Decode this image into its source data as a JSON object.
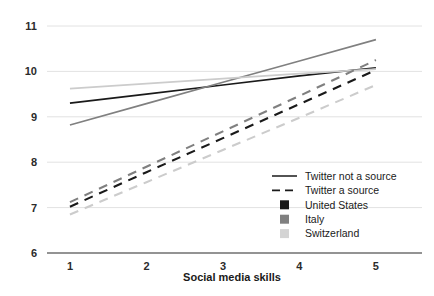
{
  "chart_data": {
    "type": "line",
    "title": "",
    "xlabel": "Social media skills",
    "ylabel": "",
    "x": [
      1,
      2,
      3,
      4,
      5
    ],
    "xlim": [
      0.7,
      5.55
    ],
    "ylim": [
      6,
      11
    ],
    "xticks": [
      "1",
      "2",
      "3",
      "4",
      "5"
    ],
    "yticks": [
      "6",
      "7",
      "8",
      "9",
      "10",
      "11"
    ],
    "grid": "horizontal",
    "legend_position": "bottom-right",
    "series": [
      {
        "name": "United States – Twitter not a source",
        "country": "United States",
        "condition": "Twitter not a source",
        "style": "solid",
        "color": "#1a1a1a",
        "values": [
          9.3,
          9.5,
          9.7,
          9.9,
          10.08
        ]
      },
      {
        "name": "Italy – Twitter not a source",
        "country": "Italy",
        "condition": "Twitter not a source",
        "style": "solid",
        "color": "#808080",
        "values": [
          8.82,
          9.29,
          9.76,
          10.23,
          10.7
        ]
      },
      {
        "name": "Switzerland – Twitter not a source",
        "country": "Switzerland",
        "condition": "Twitter not a source",
        "style": "solid",
        "color": "#cccccc",
        "values": [
          9.62,
          9.73,
          9.84,
          9.95,
          10.05
        ]
      },
      {
        "name": "United States – Twitter a source",
        "country": "United States",
        "condition": "Twitter a source",
        "style": "dashed",
        "color": "#1a1a1a",
        "values": [
          7.02,
          7.78,
          8.53,
          9.28,
          10.03
        ]
      },
      {
        "name": "Italy – Twitter a source",
        "country": "Italy",
        "condition": "Twitter a source",
        "style": "dashed",
        "color": "#808080",
        "values": [
          7.12,
          7.9,
          8.68,
          9.46,
          10.25
        ]
      },
      {
        "name": "Switzerland – Twitter a source",
        "country": "Switzerland",
        "condition": "Twitter a source",
        "style": "dashed",
        "color": "#cccccc",
        "values": [
          6.85,
          7.56,
          8.27,
          8.98,
          9.7
        ]
      }
    ],
    "legend": [
      {
        "label": "Twitter not a source",
        "marker": "solid-line",
        "color": "#1a1a1a"
      },
      {
        "label": "Twitter a source",
        "marker": "dashed-line",
        "color": "#1a1a1a"
      },
      {
        "label": "United States",
        "marker": "square",
        "color": "#1a1a1a"
      },
      {
        "label": "Italy",
        "marker": "square",
        "color": "#808080"
      },
      {
        "label": "Switzerland",
        "marker": "square",
        "color": "#d4d4d4"
      }
    ]
  },
  "axes": {
    "y_labels": [
      "11",
      "10",
      "9",
      "8",
      "7",
      "6"
    ],
    "x_labels": [
      "1",
      "2",
      "3",
      "4",
      "5"
    ],
    "x_title": "Social media skills"
  },
  "colors": {
    "united_states": "#1a1a1a",
    "italy": "#808080",
    "switzerland": "#cccccc",
    "gridline": "#e2e2e2",
    "axis": "#6f6f6f",
    "background": "#ffffff"
  }
}
